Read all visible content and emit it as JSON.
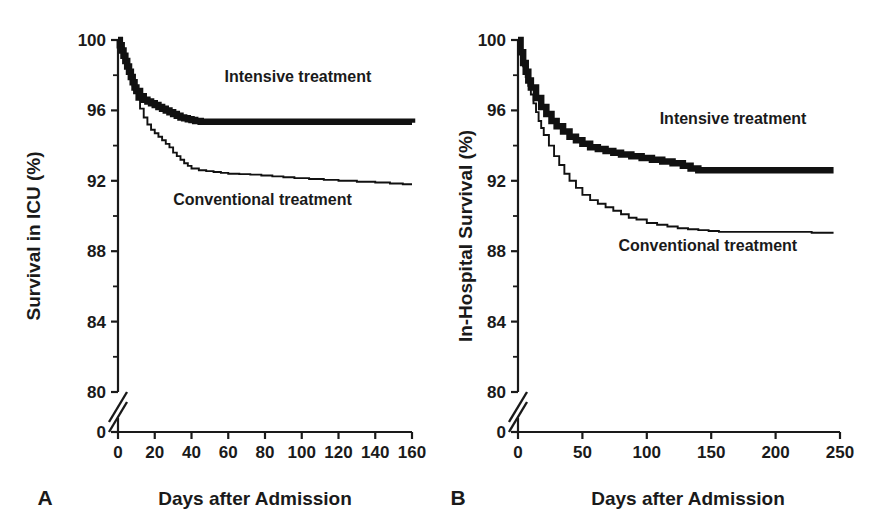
{
  "figure": {
    "background_color": "#ffffff",
    "line_color": "#111111"
  },
  "chart_data": [
    {
      "type": "line",
      "panel": "A",
      "panel_label": "A",
      "title": "",
      "xlabel": "Days after Admission",
      "ylabel": "Survival in ICU (%)",
      "xlim": [
        0,
        160
      ],
      "ylim": [
        80,
        100
      ],
      "xticks": [
        0,
        20,
        40,
        60,
        80,
        100,
        120,
        140,
        160
      ],
      "yticks": [
        80,
        84,
        88,
        92,
        96,
        100
      ],
      "y_minor_ticks": [
        82,
        86,
        90,
        94,
        98
      ],
      "y_axis_break": true,
      "y_axis_break_label": "0",
      "grid": false,
      "legend_position": "inline-annotations",
      "annotations": [
        {
          "text": "Intensive treatment",
          "x": 58,
          "y": 97.6
        },
        {
          "text": "Conventional treatment",
          "x": 30,
          "y": 90.6
        }
      ],
      "series": [
        {
          "name": "Intensive treatment",
          "style": "thick",
          "x": [
            0,
            1,
            2,
            3,
            4,
            5,
            6,
            7,
            8,
            9,
            10,
            12,
            14,
            16,
            18,
            20,
            22,
            24,
            26,
            28,
            30,
            32,
            34,
            36,
            38,
            40,
            42,
            45,
            160
          ],
          "y": [
            100.0,
            99.7,
            99.4,
            99.1,
            98.8,
            98.5,
            98.2,
            97.9,
            97.6,
            97.3,
            97.1,
            96.8,
            96.6,
            96.5,
            96.4,
            96.3,
            96.2,
            96.1,
            96.0,
            95.9,
            95.8,
            95.7,
            95.6,
            95.55,
            95.5,
            95.45,
            95.4,
            95.35,
            95.3
          ]
        },
        {
          "name": "Conventional treatment",
          "style": "thin",
          "x": [
            0,
            1,
            2,
            3,
            4,
            5,
            6,
            7,
            8,
            9,
            10,
            12,
            14,
            16,
            18,
            20,
            22,
            24,
            26,
            28,
            30,
            32,
            34,
            36,
            38,
            40,
            44,
            48,
            52,
            56,
            60,
            66,
            72,
            78,
            84,
            90,
            96,
            104,
            112,
            120,
            130,
            140,
            148,
            155,
            160
          ],
          "y": [
            100.0,
            99.7,
            99.4,
            99.1,
            98.8,
            98.5,
            98.2,
            97.8,
            97.4,
            97.0,
            96.6,
            96.1,
            95.6,
            95.2,
            94.9,
            94.7,
            94.5,
            94.3,
            94.1,
            93.9,
            93.6,
            93.4,
            93.2,
            93.0,
            92.85,
            92.7,
            92.6,
            92.55,
            92.5,
            92.45,
            92.4,
            92.38,
            92.35,
            92.3,
            92.25,
            92.2,
            92.15,
            92.1,
            92.05,
            92.0,
            91.95,
            91.9,
            91.85,
            91.8,
            91.8
          ]
        }
      ]
    },
    {
      "type": "line",
      "panel": "B",
      "panel_label": "B",
      "title": "",
      "xlabel": "Days after Admission",
      "ylabel": "In-Hospital Survival (%)",
      "xlim": [
        0,
        250
      ],
      "ylim": [
        80,
        100
      ],
      "xticks": [
        0,
        50,
        100,
        150,
        200,
        250
      ],
      "yticks": [
        80,
        84,
        88,
        92,
        96,
        100
      ],
      "y_minor_ticks": [
        82,
        86,
        90,
        94,
        98
      ],
      "y_axis_break": true,
      "y_axis_break_label": "0",
      "grid": false,
      "legend_position": "inline-annotations",
      "annotations": [
        {
          "text": "Intensive treatment",
          "x": 110,
          "y": 95.2
        },
        {
          "text": "Conventional treatment",
          "x": 78,
          "y": 88.0
        }
      ],
      "series": [
        {
          "name": "Intensive treatment",
          "style": "thick",
          "x": [
            0,
            2,
            4,
            6,
            8,
            10,
            14,
            18,
            22,
            26,
            30,
            35,
            40,
            45,
            50,
            56,
            62,
            68,
            74,
            80,
            88,
            96,
            104,
            112,
            120,
            128,
            134,
            140,
            245
          ],
          "y": [
            100.0,
            99.3,
            98.7,
            98.2,
            97.7,
            97.3,
            96.7,
            96.2,
            95.8,
            95.4,
            95.1,
            94.8,
            94.5,
            94.3,
            94.1,
            93.9,
            93.8,
            93.7,
            93.6,
            93.5,
            93.4,
            93.3,
            93.2,
            93.1,
            93.0,
            92.85,
            92.7,
            92.6,
            92.6
          ]
        },
        {
          "name": "Conventional treatment",
          "style": "thin",
          "x": [
            0,
            2,
            4,
            6,
            8,
            10,
            12,
            14,
            16,
            18,
            20,
            24,
            28,
            32,
            36,
            40,
            45,
            50,
            56,
            62,
            68,
            74,
            80,
            86,
            92,
            100,
            108,
            116,
            124,
            132,
            140,
            148,
            156,
            165,
            180,
            200,
            220,
            228,
            245
          ],
          "y": [
            100.0,
            99.2,
            98.5,
            97.9,
            97.4,
            96.9,
            96.4,
            95.9,
            95.4,
            95.0,
            94.6,
            94.0,
            93.4,
            92.9,
            92.4,
            92.0,
            91.6,
            91.2,
            90.9,
            90.7,
            90.5,
            90.3,
            90.1,
            89.9,
            89.8,
            89.6,
            89.5,
            89.4,
            89.3,
            89.25,
            89.2,
            89.15,
            89.1,
            89.1,
            89.1,
            89.1,
            89.1,
            89.05,
            89.05
          ]
        }
      ]
    }
  ]
}
